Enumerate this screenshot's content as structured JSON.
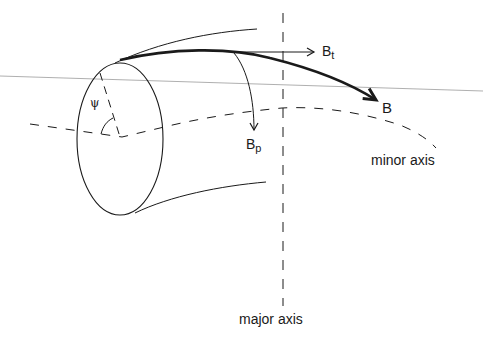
{
  "diagram": {
    "labels": {
      "toroidal_field": "B",
      "toroidal_field_sub": "t",
      "poloidal_field": "B",
      "poloidal_field_sub": "p",
      "total_field": "B",
      "poloidal_angle": "ψ",
      "minor_axis": "minor axis",
      "major_axis": "major axis"
    },
    "colors": {
      "ink": "#1a1a1a",
      "background": "#ffffff",
      "rule_line": "#9a9a9a"
    }
  }
}
